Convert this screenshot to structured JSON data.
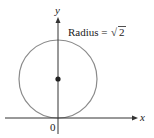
{
  "diagram": {
    "axes": {
      "x_label": "x",
      "y_label": "y",
      "origin_label": "0"
    },
    "annotation": {
      "radius_text": "Radius = ",
      "radius_value": "2",
      "radical_symbol": "√"
    },
    "circle": {
      "center": [
        0,
        1
      ],
      "radius_description": "√2",
      "stroke_color": "#8a8a8a"
    },
    "colors": {
      "axis": "#333333",
      "circle": "#8a8a8a",
      "center_point": "#222222"
    }
  }
}
